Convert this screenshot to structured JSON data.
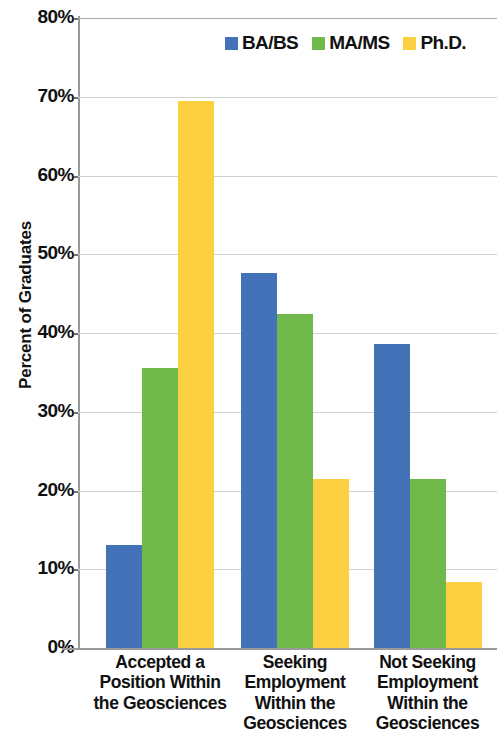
{
  "chart_data": {
    "type": "bar",
    "title": "",
    "subtitle": "",
    "xlabel": "",
    "ylabel": "Percent of Graduates",
    "ylim": [
      0,
      80
    ],
    "y_tick_labels": [
      "80%",
      "70%",
      "60%",
      "50%",
      "40%",
      "30%",
      "20%",
      "10%",
      "0%"
    ],
    "y_tick_values": [
      80,
      70,
      60,
      50,
      40,
      30,
      20,
      10,
      0
    ],
    "y_unit": "%",
    "grid": "horizontal",
    "legend_position": "top-right",
    "categories": [
      "Accepted a Position Within the Geosciences",
      "Seeking Employment Within the Geosciences",
      "Not Seeking Employment Within the Geosciences"
    ],
    "category_lines": [
      [
        "Accepted a",
        "Position Within",
        "the Geosciences"
      ],
      [
        "Seeking",
        "Employment",
        "Within the",
        "Geosciences"
      ],
      [
        "Not Seeking",
        "Employment",
        "Within the",
        "Geosciences"
      ]
    ],
    "series": [
      {
        "name": "BA/BS",
        "color": "#4472b8",
        "values": [
          13.1,
          47.6,
          38.6
        ]
      },
      {
        "name": "MA/MS",
        "color": "#70b84a",
        "values": [
          35.6,
          42.4,
          21.4
        ]
      },
      {
        "name": "Ph.D.",
        "color": "#fcd040",
        "values": [
          69.5,
          21.4,
          8.4
        ]
      }
    ]
  },
  "legend": {
    "items": [
      {
        "label": "BA/BS",
        "color": "#4472b8"
      },
      {
        "label": "MA/MS",
        "color": "#70b84a"
      },
      {
        "label": "Ph.D.",
        "color": "#fcd040"
      }
    ]
  }
}
